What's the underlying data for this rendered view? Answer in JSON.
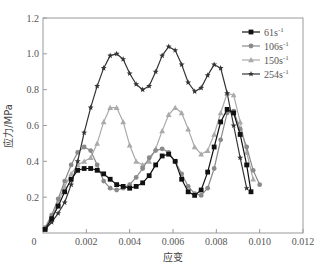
{
  "chart_data": {
    "type": "line",
    "title": "",
    "xlabel": "应变",
    "ylabel": "应力/MPa",
    "xlim": [
      0,
      0.012
    ],
    "ylim": [
      0,
      1.2
    ],
    "xticks": [
      0.002,
      0.004,
      0.006,
      0.008,
      0.01,
      0.012
    ],
    "xtick_labels": [
      "0.002",
      "0.004",
      "0.006",
      "0.008",
      "0.010",
      "0.012"
    ],
    "yticks": [
      0.2,
      0.4,
      0.6,
      0.8,
      1.0,
      1.2
    ],
    "ytick_labels": [
      "0.2",
      "0.4",
      "0.6",
      "0.8",
      "1.0",
      "1.2"
    ],
    "origin_label": "0",
    "grid": false,
    "legend_position": "upper right",
    "series": [
      {
        "name": "61s⁻¹",
        "label_base": "61s",
        "label_sup": "-1",
        "color": "#111111",
        "marker": "square",
        "x": [
          0.0001,
          0.0004,
          0.0007,
          0.001,
          0.0013,
          0.0016,
          0.0019,
          0.0022,
          0.0025,
          0.0028,
          0.0031,
          0.0034,
          0.0037,
          0.004,
          0.0043,
          0.0046,
          0.0049,
          0.0052,
          0.0055,
          0.0058,
          0.0061,
          0.0064,
          0.0067,
          0.007,
          0.0073,
          0.0076,
          0.0079,
          0.0082,
          0.0085,
          0.0088,
          0.0091,
          0.0094,
          0.0096
        ],
        "y": [
          0.02,
          0.08,
          0.15,
          0.23,
          0.3,
          0.35,
          0.36,
          0.36,
          0.35,
          0.33,
          0.3,
          0.27,
          0.26,
          0.25,
          0.26,
          0.28,
          0.32,
          0.38,
          0.43,
          0.44,
          0.4,
          0.3,
          0.23,
          0.21,
          0.24,
          0.34,
          0.48,
          0.62,
          0.69,
          0.67,
          0.55,
          0.38,
          0.23
        ]
      },
      {
        "name": "106s⁻¹",
        "label_base": "106s",
        "label_sup": "-1",
        "color": "#8a8a8a",
        "marker": "circle",
        "x": [
          0.0001,
          0.0004,
          0.0007,
          0.001,
          0.0013,
          0.0016,
          0.0019,
          0.0022,
          0.0025,
          0.0028,
          0.0031,
          0.0034,
          0.0037,
          0.004,
          0.0043,
          0.0046,
          0.0049,
          0.0052,
          0.0055,
          0.0058,
          0.0061,
          0.0064,
          0.0067,
          0.007,
          0.0073,
          0.0076,
          0.0079,
          0.0082,
          0.0085,
          0.0088,
          0.0091,
          0.0094,
          0.0097,
          0.01
        ],
        "y": [
          0.03,
          0.1,
          0.19,
          0.29,
          0.38,
          0.45,
          0.48,
          0.46,
          0.38,
          0.29,
          0.25,
          0.24,
          0.25,
          0.27,
          0.31,
          0.36,
          0.42,
          0.46,
          0.47,
          0.45,
          0.4,
          0.33,
          0.26,
          0.22,
          0.21,
          0.25,
          0.36,
          0.52,
          0.67,
          0.68,
          0.58,
          0.48,
          0.35,
          0.27
        ]
      },
      {
        "name": "150s⁻¹",
        "label_base": "150s",
        "label_sup": "-1",
        "color": "#aaaaaa",
        "marker": "triangle",
        "x": [
          0.0001,
          0.0004,
          0.0007,
          0.001,
          0.0013,
          0.0016,
          0.0019,
          0.0022,
          0.0025,
          0.0028,
          0.0031,
          0.0034,
          0.0037,
          0.004,
          0.0043,
          0.0046,
          0.0049,
          0.0052,
          0.0055,
          0.0058,
          0.0061,
          0.0064,
          0.0067,
          0.007,
          0.0073,
          0.0076,
          0.0079,
          0.0082,
          0.0085,
          0.0088,
          0.0091,
          0.0094,
          0.0097
        ],
        "y": [
          0.03,
          0.09,
          0.17,
          0.26,
          0.33,
          0.38,
          0.4,
          0.42,
          0.5,
          0.62,
          0.7,
          0.7,
          0.62,
          0.49,
          0.4,
          0.38,
          0.4,
          0.47,
          0.57,
          0.66,
          0.7,
          0.67,
          0.58,
          0.48,
          0.44,
          0.46,
          0.55,
          0.67,
          0.78,
          0.77,
          0.62,
          0.45,
          0.3
        ]
      },
      {
        "name": "254s⁻¹",
        "label_base": "254s",
        "label_sup": "-1",
        "color": "#333333",
        "marker": "star",
        "x": [
          0.0001,
          0.0004,
          0.0007,
          0.001,
          0.0013,
          0.0016,
          0.0019,
          0.0022,
          0.0025,
          0.0028,
          0.0031,
          0.0034,
          0.0037,
          0.004,
          0.0043,
          0.0046,
          0.0049,
          0.0052,
          0.0055,
          0.0058,
          0.0061,
          0.0064,
          0.0067,
          0.007,
          0.0073,
          0.0076,
          0.0079,
          0.0082,
          0.0085,
          0.0088,
          0.0091,
          0.0094
        ],
        "y": [
          0.02,
          0.06,
          0.11,
          0.17,
          0.27,
          0.4,
          0.56,
          0.7,
          0.82,
          0.92,
          0.99,
          1.0,
          0.97,
          0.89,
          0.83,
          0.8,
          0.82,
          0.9,
          0.99,
          1.04,
          1.02,
          0.94,
          0.84,
          0.79,
          0.81,
          0.88,
          0.94,
          0.92,
          0.78,
          0.6,
          0.42,
          0.25
        ]
      }
    ]
  }
}
